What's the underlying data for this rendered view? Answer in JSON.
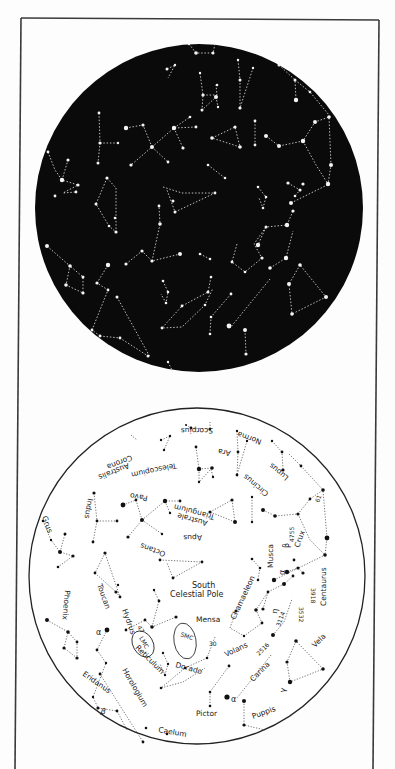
{
  "page": {
    "background": "#fdfdfd",
    "frame_color": "#3a3a3a"
  },
  "top_chart": {
    "name": "Southern sky star field (dark)",
    "background": "#0a0a0a",
    "star_color": "#f2f2f2",
    "line_style": "dotted"
  },
  "bottom_chart": {
    "name": "Southern sky key chart (labeled)",
    "background": "#ffffff",
    "ink_color": "#1a1a1a",
    "center_label_line1": "South",
    "center_label_line2": "Celestial Pole",
    "constellations": [
      {
        "id": "scorpius",
        "label": "Scorpius"
      },
      {
        "id": "corona-australis",
        "label": "Corona Australis"
      },
      {
        "id": "telescopium",
        "label": "Telescopium"
      },
      {
        "id": "ara",
        "label": "Ara"
      },
      {
        "id": "norma",
        "label": "Norma"
      },
      {
        "id": "lupus",
        "label": "Lupus"
      },
      {
        "id": "circinus",
        "label": "Circinus"
      },
      {
        "id": "indus",
        "label": "Indus"
      },
      {
        "id": "pavo",
        "label": "Pavo"
      },
      {
        "id": "triangulum-australe",
        "label": "Triangulum Australe"
      },
      {
        "id": "grus",
        "label": "Grus"
      },
      {
        "id": "apus",
        "label": "Apus"
      },
      {
        "id": "octans",
        "label": "Octans"
      },
      {
        "id": "musca",
        "label": "Musca"
      },
      {
        "id": "crux",
        "label": "Crux"
      },
      {
        "id": "centaurus",
        "label": "Centaurus"
      },
      {
        "id": "toucan",
        "label": "Toucan"
      },
      {
        "id": "phoenix",
        "label": "Phoenix"
      },
      {
        "id": "hydrus",
        "label": "Hydrus"
      },
      {
        "id": "chamaeleon",
        "label": "Chamaeleon"
      },
      {
        "id": "mensa",
        "label": "Mensa"
      },
      {
        "id": "reticulum",
        "label": "Reticulum"
      },
      {
        "id": "dorado",
        "label": "Dorado"
      },
      {
        "id": "volans",
        "label": "Volans"
      },
      {
        "id": "carina",
        "label": "Carina"
      },
      {
        "id": "vela",
        "label": "Vela"
      },
      {
        "id": "eridanus",
        "label": "Eridanus"
      },
      {
        "id": "horologium",
        "label": "Horologium"
      },
      {
        "id": "pictor",
        "label": "Pictor"
      },
      {
        "id": "puppis",
        "label": "Puppis"
      },
      {
        "id": "caelum",
        "label": "Caelum"
      }
    ],
    "objects": {
      "lmc": "LMC",
      "smc": "SMC",
      "ngc47": "47",
      "ngc30": "30",
      "n4755": "4755",
      "n3918": "3918",
      "n3532": "3532",
      "n3114": "3114",
      "n2516": "2516",
      "n61": "61"
    },
    "greek": {
      "alpha": "α",
      "beta": "β",
      "gamma": "γ",
      "eta": "η"
    }
  }
}
